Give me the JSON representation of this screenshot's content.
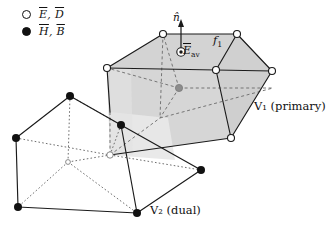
{
  "figure": {
    "type": "mesh-duality-diagram",
    "background": "#ffffff",
    "width": 326,
    "height": 229
  },
  "legend": {
    "rows": [
      {
        "marker": "open-circle",
        "marker_name": "open-circle-marker",
        "symbols": "E, D",
        "label_html": "Ē, D̄",
        "meaning": "primary grid electric quantities"
      },
      {
        "marker": "filled-circle",
        "marker_name": "filled-circle-marker",
        "symbols": "H, B",
        "label_html": "H̄, B̄",
        "meaning": "dual grid magnetic quantities"
      }
    ]
  },
  "labels": {
    "primary_cell": "V₁ (primary)",
    "dual_cell": "V₂ (dual)",
    "face": "f₁",
    "normal_vector": "n̂",
    "average_field": "ℰ̄av",
    "average_field_base": "ℰ",
    "average_field_sub": "av"
  },
  "colors": {
    "stroke": "#1a1a1a",
    "face_fill": "#d2d2d2",
    "face_fill_light": "#e4e4e4",
    "face_fill_lighter": "#ededed",
    "center_node": "#8c8c8c",
    "hidden_edge": "#555555",
    "background": "#ffffff"
  },
  "geometry": {
    "primary_cell": {
      "name": "V1-primary-polyhedron",
      "node_style": "open-circle",
      "vertices": [
        {
          "id": "p-top-left",
          "x": 163,
          "y": 34
        },
        {
          "id": "p-top-right",
          "x": 237,
          "y": 34
        },
        {
          "id": "p-right-upper",
          "x": 272,
          "y": 71
        },
        {
          "id": "p-right",
          "x": 273,
          "y": 88
        },
        {
          "id": "p-mid-left",
          "x": 107,
          "y": 68
        },
        {
          "id": "p-mid-right",
          "x": 216,
          "y": 70
        },
        {
          "id": "p-bottom-right",
          "x": 231,
          "y": 138
        },
        {
          "id": "p-bottom-hidden",
          "x": 110,
          "y": 155
        }
      ],
      "center_node": {
        "id": "p-center",
        "x": 179,
        "y": 88
      }
    },
    "dual_cell": {
      "name": "V2-dual-hexahedron",
      "node_style": "filled-circle",
      "vertices": [
        {
          "id": "d-top-back-left",
          "x": 70,
          "y": 96
        },
        {
          "id": "d-top-front-left",
          "x": 16,
          "y": 138
        },
        {
          "id": "d-top-back-right",
          "x": 121,
          "y": 125
        },
        {
          "id": "d-bottom-front-left",
          "x": 18,
          "y": 207
        },
        {
          "id": "d-bottom-back-right",
          "x": 137,
          "y": 213
        },
        {
          "id": "d-bottom-right",
          "x": 201,
          "y": 170
        }
      ]
    },
    "normal_arrow": {
      "from_x": 181,
      "from_y": 46,
      "to_x": 181,
      "to_y": 22
    },
    "field_marker": {
      "x": 181,
      "y": 52,
      "style": "circled-dot"
    }
  }
}
